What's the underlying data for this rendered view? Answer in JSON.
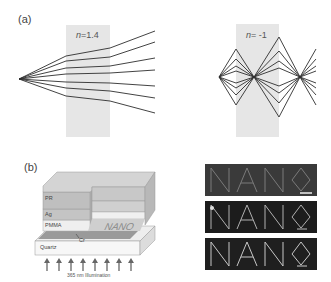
{
  "figure": {
    "panel_a": {
      "label": "(a)",
      "left_diagram": {
        "n_symbol": "n",
        "n_value": "=1.4",
        "slab_color": "#e6e6e6",
        "ray_color": "#333333"
      },
      "right_diagram": {
        "n_symbol": "n",
        "n_value": "= -1",
        "slab_color": "#e6e6e6",
        "ray_color": "#333333"
      }
    },
    "panel_b": {
      "label": "(b)",
      "schematic": {
        "layers": [
          "PR",
          "Ag",
          "PMMA",
          "Cr",
          "Quartz"
        ],
        "pattern_text": "NANO",
        "illumination_label": "365 nm Illumination",
        "arrow_count": 8
      },
      "micrographs": {
        "count": 3,
        "text": "NANO",
        "background": "#2a2a2a",
        "scale_bar": true
      }
    }
  }
}
